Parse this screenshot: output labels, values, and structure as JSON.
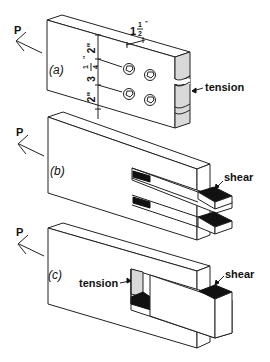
{
  "figure": {
    "force_label": "P",
    "panels": [
      {
        "id": "a",
        "label": "(a)",
        "failure_label": "tension",
        "dimensions": {
          "edge_top": "2\"",
          "spacing_whole": "3",
          "spacing_num": "1",
          "spacing_den": "4",
          "spacing_unit": "\"",
          "edge_bottom": "2\"",
          "end_whole": "1",
          "end_num": "1",
          "end_den": "2",
          "end_unit": "\""
        },
        "bolt_count": 4
      },
      {
        "id": "b",
        "label": "(b)",
        "failure_label": "shear"
      },
      {
        "id": "c",
        "label": "(c)",
        "failure_label_left": "tension",
        "failure_label_right": "shear"
      }
    ]
  },
  "colors": {
    "line": "#222222",
    "shaded": "#d9d9d9",
    "dark": "#111111",
    "background": "#ffffff"
  }
}
